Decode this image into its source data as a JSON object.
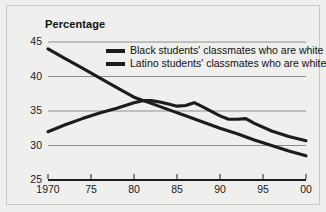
{
  "figure": {
    "title": "Percentage",
    "background_color": "#efefed",
    "frame_color": "#c9c9c5"
  },
  "legend": {
    "position": "upper-center",
    "entries": [
      {
        "label": "Black students' classmates who are white",
        "color": "#1c1c1c"
      },
      {
        "label": "Latino students' classmates who are white",
        "color": "#1c1c1c"
      }
    ]
  },
  "axes": {
    "y_ticks": [
      "45",
      "40",
      "35",
      "30",
      "25"
    ],
    "x_ticks": [
      "1970",
      "75",
      "80",
      "85",
      "90",
      "95",
      "00"
    ]
  },
  "chart_data": {
    "type": "line",
    "title": "Percentage",
    "xlabel": "",
    "ylabel": "Percentage",
    "xlim": [
      1970,
      2000
    ],
    "ylim": [
      25,
      45
    ],
    "grid": true,
    "grid_values": [
      45,
      40,
      35,
      30
    ],
    "legend_position": "upper-center",
    "x_tick_values": [
      1970,
      1975,
      1980,
      1985,
      1990,
      1995,
      2000
    ],
    "x_tick_labels": [
      "1970",
      "75",
      "80",
      "85",
      "90",
      "95",
      "00"
    ],
    "y_tick_values": [
      45,
      40,
      35,
      30,
      25
    ],
    "y_tick_labels": [
      "45",
      "40",
      "35",
      "30",
      "25"
    ],
    "series": [
      {
        "name": "Black students' classmates who are white",
        "color": "#1c1c1c",
        "x": [
          1970,
          1972,
          1974,
          1976,
          1978,
          1980,
          1982,
          1984,
          1986,
          1988,
          1990,
          1992,
          1994,
          1996,
          1998,
          2000
        ],
        "values": [
          44.0,
          42.6,
          41.2,
          39.8,
          38.4,
          37.0,
          36.1,
          35.2,
          34.3,
          33.4,
          32.5,
          31.7,
          30.8,
          30.0,
          29.2,
          28.5
        ]
      },
      {
        "name": "Latino students' classmates who are white",
        "color": "#1c1c1c",
        "x": [
          1970,
          1972,
          1974,
          1976,
          1978,
          1980,
          1981,
          1982,
          1983,
          1984,
          1985,
          1986,
          1987,
          1988,
          1990,
          1991,
          1992,
          1993,
          1994,
          1996,
          1998,
          2000
        ],
        "values": [
          32.0,
          33.0,
          33.9,
          34.7,
          35.4,
          36.2,
          36.5,
          36.5,
          36.3,
          36.0,
          35.7,
          35.8,
          36.2,
          35.6,
          34.3,
          33.8,
          33.8,
          33.9,
          33.2,
          32.1,
          31.3,
          30.7
        ]
      }
    ]
  }
}
